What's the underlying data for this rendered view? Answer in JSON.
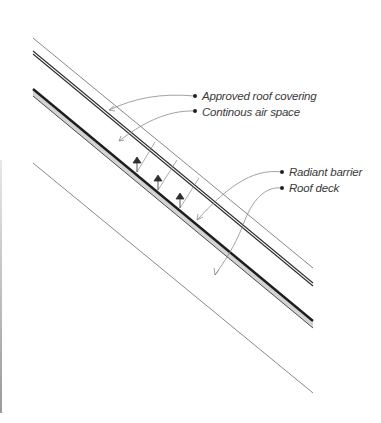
{
  "diagram": {
    "labels": [
      {
        "id": "roof-covering",
        "text": "Approved roof covering"
      },
      {
        "id": "air-space",
        "text": "Continous air space"
      },
      {
        "id": "radiant-barrier",
        "text": "Radiant barrier"
      },
      {
        "id": "roof-deck",
        "text": "Roof deck"
      }
    ],
    "colors": {
      "line": "#3a3a3a",
      "thin_line": "#6a6a6a",
      "deck_fill": "#d4d4d4",
      "leader": "#8a8a8a"
    }
  }
}
